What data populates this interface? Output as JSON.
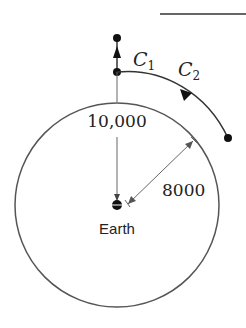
{
  "diagram": {
    "labels": {
      "c1": "C",
      "c1_sub": "1",
      "c2": "C",
      "c2_sub": "2",
      "altitude": "10,000",
      "radius": "8000",
      "earth": "Earth"
    },
    "colors": {
      "stroke": "#444444",
      "dot": "#111111",
      "background": "#ffffff"
    }
  }
}
